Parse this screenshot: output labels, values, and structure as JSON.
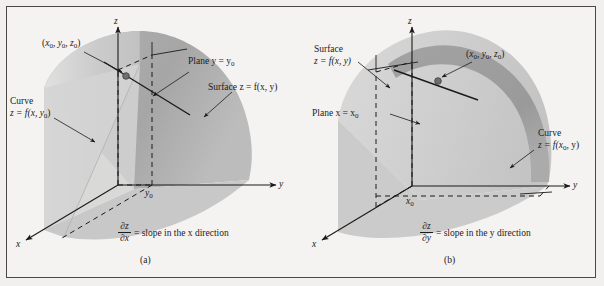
{
  "figure": {
    "background": "#f4f3f1",
    "ink": "#1b1b1b",
    "surface_light": "#cfcfcf",
    "surface_dark": "#a8a8a8",
    "surface_band": "#9a9a9a",
    "point_color": "#6b6b6b"
  },
  "panels": [
    {
      "id": "a",
      "caption": "(a)",
      "axes": {
        "x": "x",
        "y": "y",
        "z": "z"
      },
      "tick": "y",
      "tick_sub": "0",
      "labels": {
        "point": {
          "open": "(",
          "x": "x",
          "x_sub": "0",
          "sep1": ", ",
          "y": "y",
          "y_sub": "0",
          "sep2": ", ",
          "z": "z",
          "z_sub": "0",
          "close": ")"
        },
        "curve_title": "Curve",
        "curve_eq_lhs": "z",
        "curve_eq": " = f(x, y",
        "curve_eq_sub": "0",
        "curve_eq_end": ")",
        "plane": "Plane y = y",
        "plane_sub": "0",
        "surface": "Surface z = f(x, y)"
      },
      "formula": {
        "numerator": "∂z",
        "denominator": "∂x",
        "text": "= slope in the x direction"
      }
    },
    {
      "id": "b",
      "caption": "(b)",
      "axes": {
        "x": "x",
        "y": "y",
        "z": "z"
      },
      "tick": "x",
      "tick_sub": "0",
      "labels": {
        "point": {
          "open": "(",
          "x": "x",
          "x_sub": "0",
          "sep1": ", ",
          "y": "y",
          "y_sub": "0",
          "sep2": ", ",
          "z": "z",
          "z_sub": "0",
          "close": ")"
        },
        "surface_title": "Surface",
        "surface_eq": "z = f(x, y)",
        "plane": "Plane x = x",
        "plane_sub": "0",
        "curve_title": "Curve",
        "curve_eq_lhs": "z",
        "curve_eq": " = f(x",
        "curve_eq_sub": "0",
        "curve_eq_end": ", y)"
      },
      "formula": {
        "numerator": "∂z",
        "denominator": "∂y",
        "text": "= slope in the y direction"
      }
    }
  ]
}
